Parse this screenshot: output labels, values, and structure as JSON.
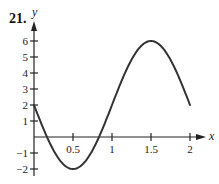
{
  "problem_number": "21.",
  "chart_data": {
    "type": "line",
    "title": "",
    "xlabel": "x",
    "ylabel": "y",
    "xlim": [
      0,
      2.15
    ],
    "ylim": [
      -2.3,
      7.3
    ],
    "grid": false,
    "legend": null,
    "x_ticks": [
      0.5,
      1,
      1.5,
      2
    ],
    "x_tick_labels": [
      "0.5",
      "1",
      "1.5",
      "2"
    ],
    "y_ticks": [
      -2,
      -1,
      1,
      2,
      3,
      4,
      5,
      6
    ],
    "y_tick_labels": [
      "−2",
      "−1",
      "1",
      "2",
      "3",
      "4",
      "5",
      "6"
    ],
    "series": [
      {
        "name": "f(x)",
        "x": [
          0,
          0.1,
          0.167,
          0.25,
          0.3,
          0.4,
          0.5,
          0.6,
          0.7,
          0.75,
          0.833,
          0.9,
          1.0,
          1.1,
          1.2,
          1.25,
          1.3,
          1.4,
          1.5,
          1.6,
          1.7,
          1.75,
          1.8,
          1.9,
          2.0
        ],
        "y": [
          2,
          0.76,
          0,
          -0.83,
          -1.24,
          -1.8,
          -2,
          -1.8,
          -1.24,
          -0.83,
          0,
          0.76,
          2,
          3.24,
          4.35,
          4.83,
          5.24,
          5.8,
          6,
          5.8,
          5.24,
          4.83,
          4.35,
          3.24,
          2
        ]
      }
    ],
    "key_points": [
      {
        "x": 0,
        "y": 2,
        "note": "start"
      },
      {
        "x": 0.5,
        "y": -2,
        "note": "minimum"
      },
      {
        "x": 1.5,
        "y": 6,
        "note": "maximum"
      },
      {
        "x": 2,
        "y": 2,
        "note": "end"
      }
    ]
  }
}
